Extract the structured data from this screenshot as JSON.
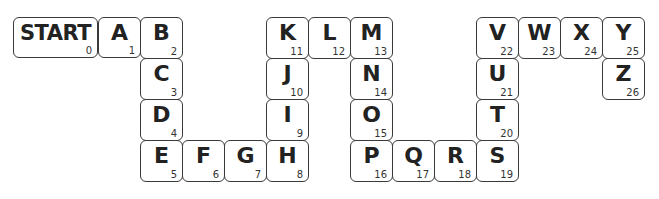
{
  "tiles": [
    {
      "label": "START",
      "number": "0"
    },
    {
      "label": "A",
      "number": "1"
    },
    {
      "label": "B",
      "number": "2"
    },
    {
      "label": "C",
      "number": "3"
    },
    {
      "label": "D",
      "number": "4"
    },
    {
      "label": "E",
      "number": "5"
    },
    {
      "label": "F",
      "number": "6"
    },
    {
      "label": "G",
      "number": "7"
    },
    {
      "label": "H",
      "number": "8"
    },
    {
      "label": "I",
      "number": "9"
    },
    {
      "label": "J",
      "number": "10"
    },
    {
      "label": "K",
      "number": "11"
    },
    {
      "label": "L",
      "number": "12"
    },
    {
      "label": "M",
      "number": "13"
    },
    {
      "label": "N",
      "number": "14"
    },
    {
      "label": "O",
      "number": "15"
    },
    {
      "label": "P",
      "number": "16"
    },
    {
      "label": "Q",
      "number": "17"
    },
    {
      "label": "R",
      "number": "18"
    },
    {
      "label": "S",
      "number": "19"
    },
    {
      "label": "T",
      "number": "20"
    },
    {
      "label": "U",
      "number": "21"
    },
    {
      "label": "V",
      "number": "22"
    },
    {
      "label": "W",
      "number": "23"
    },
    {
      "label": "X",
      "number": "24"
    },
    {
      "label": "Y",
      "number": "25"
    },
    {
      "label": "Z",
      "number": "26"
    }
  ]
}
